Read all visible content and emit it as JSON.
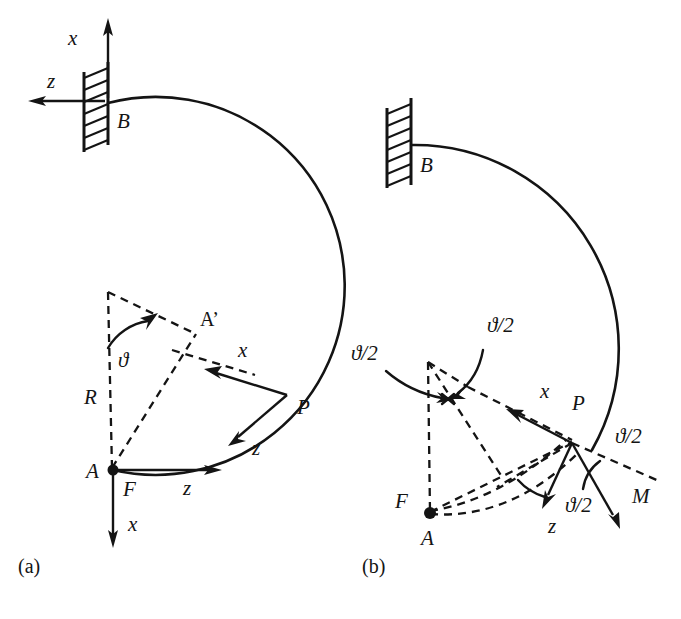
{
  "figure": {
    "background_color": "#ffffff",
    "ink_color": "#141414",
    "panels": [
      {
        "id": "a",
        "caption": "(a)",
        "description": "Circular curved cantilever beam fixed at B, loaded by force F at free end A",
        "labels": {
          "support_point": "B",
          "free_end_point": "A",
          "displaced_point": "A’",
          "generic_point": "P",
          "radius": "R",
          "angle": "ϑ",
          "force": "F",
          "global_axis_x": "x",
          "global_axis_z": "z",
          "local_axis_x": "x",
          "local_axis_z": "z",
          "end_axis_x": "x",
          "end_axis_z": "z"
        }
      },
      {
        "id": "b",
        "caption": "(b)",
        "description": "Same curved cantilever fixed at B, loaded by moment M at free end A",
        "labels": {
          "support_point": "B",
          "free_end_point": "A",
          "force_label": "F",
          "generic_point": "P",
          "moment": "M",
          "half_angle_top": "ϑ/2",
          "half_angle_left": "ϑ/2",
          "half_angle_z": "ϑ/2",
          "half_angle_m": "ϑ/2",
          "local_axis_x": "x",
          "local_axis_z": "z"
        }
      }
    ]
  }
}
